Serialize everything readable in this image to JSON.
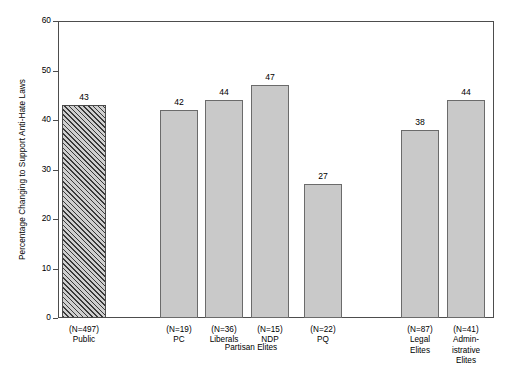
{
  "chart_data": {
    "type": "bar",
    "title": "",
    "xlabel": "",
    "ylabel": "Percentage Changing to Support Anti-Hate Laws",
    "ylim": [
      0,
      60
    ],
    "yticks": [
      0,
      10,
      20,
      30,
      40,
      50,
      60
    ],
    "grid": false,
    "legend": "none",
    "categories": [
      "(N=497)\nPublic",
      "(N=19)\nPC",
      "(N=36)\nLiberals",
      "(N=15)\nNDP",
      "(N=22)\nPQ",
      "(N=87)\nLegal\nElites",
      "(N=41)\nAdmin-\nistrative\nElites"
    ],
    "values": [
      43,
      42,
      44,
      47,
      27,
      38,
      44
    ],
    "bar_fills": [
      "hatched",
      "solid",
      "solid",
      "solid",
      "solid",
      "solid",
      "solid"
    ],
    "group_annotations": [
      {
        "label": "Partisan Elites",
        "spans": [
          "(N=19)\nPC",
          "(N=36)\nLiberals",
          "(N=15)\nNDP",
          "(N=22)\nPQ"
        ]
      }
    ],
    "colors": {
      "bar_fill": "#c9c9c9",
      "bar_edge": "#6b6b6b",
      "hatch_line": "#3a3a3a",
      "axis": "#4d4d4d",
      "text": "#000000",
      "background": "#ffffff"
    }
  },
  "bars": [
    {
      "n_label": "(N=497)",
      "name": "Public",
      "value": "43",
      "left": 62,
      "width": 44,
      "fill": "hatched",
      "label_left": 48,
      "label_width": 72
    },
    {
      "n_label": "(N=19)",
      "name": "PC",
      "value": "42",
      "left": 160,
      "width": 38,
      "fill": "solid",
      "label_left": 143,
      "label_width": 72
    },
    {
      "n_label": "(N=36)",
      "name": "Liberals",
      "value": "44",
      "left": 205,
      "width": 38,
      "fill": "solid",
      "label_left": 188,
      "label_width": 72
    },
    {
      "n_label": "(N=15)",
      "name": "NDP",
      "value": "47",
      "left": 251,
      "width": 38,
      "fill": "solid",
      "label_left": 234,
      "label_width": 72
    },
    {
      "n_label": "(N=22)",
      "name": "PQ",
      "value": "27",
      "left": 304,
      "width": 38,
      "fill": "solid",
      "label_left": 287,
      "label_width": 72
    },
    {
      "n_label": "(N=87)",
      "name": "Legal\nElites",
      "value": "38",
      "left": 401,
      "width": 38,
      "fill": "solid",
      "label_left": 384,
      "label_width": 72
    },
    {
      "n_label": "(N=41)",
      "name": "Admin-\nistrative\nElites",
      "value": "44",
      "left": 447,
      "width": 38,
      "fill": "solid",
      "label_left": 430,
      "label_width": 72
    }
  ],
  "y_axis": {
    "title": "Percentage Changing to Support Anti-Hate Laws",
    "ticks": [
      "60",
      "50",
      "40",
      "30",
      "20",
      "10",
      "0"
    ]
  },
  "group_label": {
    "text": "Partisan Elites"
  }
}
